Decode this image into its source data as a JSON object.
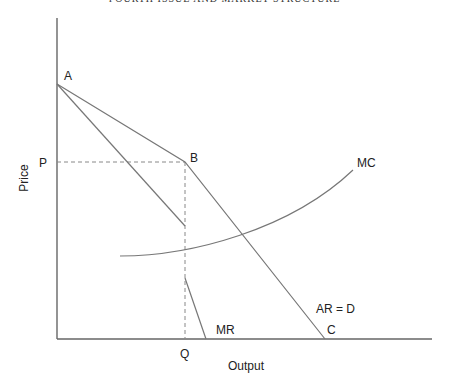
{
  "header": {
    "running_head": "FOURTH ISSUE AND MARKET STRUCTURE"
  },
  "diagram": {
    "axes": {
      "xlabel": "Output",
      "ylabel": "Price"
    },
    "points": {
      "A": "A",
      "B": "B",
      "C": "C",
      "P": "P",
      "Q": "Q"
    },
    "curves": {
      "mc": "MC",
      "mr": "MR",
      "ard": "AR = D"
    },
    "colors": {
      "line": "#777777",
      "axis": "#666666",
      "text": "#222222"
    }
  }
}
